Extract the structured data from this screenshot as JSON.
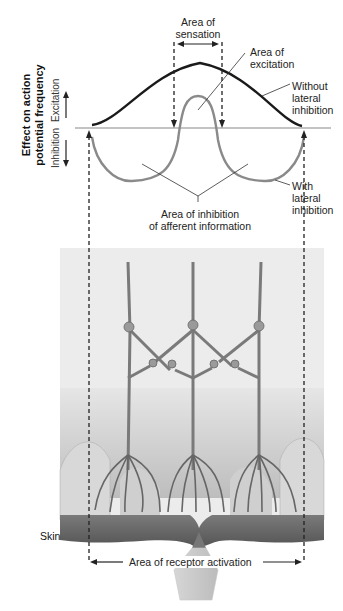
{
  "figure": {
    "y_axis": {
      "title_line1": "Effect on action",
      "title_line2": "potential frequency",
      "up_label": "Excitation",
      "down_label": "Inhibition"
    },
    "labels": {
      "area_sensation_1": "Area of",
      "area_sensation_2": "sensation",
      "area_excitation_1": "Area of",
      "area_excitation_2": "excitation",
      "without_1": "Without",
      "without_2": "lateral",
      "without_3": "inhibition",
      "with_1": "With",
      "with_2": "lateral",
      "with_3": "inhibition",
      "inhibition_area_1": "Area of inhibition",
      "inhibition_area_2": "of afferent information",
      "skin": "Skin",
      "receptor_activation": "Area of receptor activation"
    },
    "colors": {
      "without_curve": "#1a1a1a",
      "with_curve": "#8a8a8a",
      "panel_bg": "#ececec",
      "skin_dark": "#5e5e5e"
    }
  }
}
